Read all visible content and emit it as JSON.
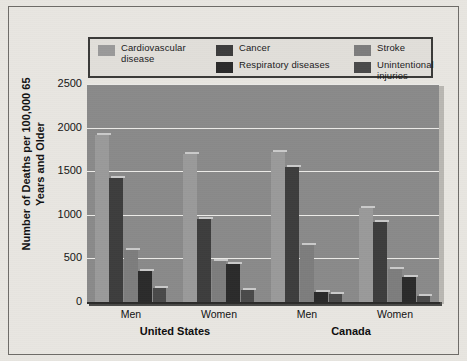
{
  "chart_data": {
    "type": "bar",
    "title": "",
    "subtitle": "",
    "xlabel": "",
    "ylabel": "Number of Deaths per\n100,000 65 Years and Older",
    "ylim": [
      0,
      2500
    ],
    "yticks": [
      0,
      500,
      1000,
      1500,
      2000,
      2500
    ],
    "ytick_labels": [
      "0",
      "500",
      "1000",
      "1500",
      "2000",
      "2500"
    ],
    "grid": true,
    "legend_position": "top",
    "categories": [
      "Men",
      "Women",
      "Men",
      "Women"
    ],
    "group_labels": [
      "United States",
      "Canada"
    ],
    "groups": [
      {
        "country": "United States",
        "sex": "Men"
      },
      {
        "country": "United States",
        "sex": "Women"
      },
      {
        "country": "Canada",
        "sex": "Men"
      },
      {
        "country": "Canada",
        "sex": "Women"
      }
    ],
    "series": [
      {
        "name": "Cardiovascular disease",
        "color": "#9a9a9a",
        "values": [
          1910,
          1700,
          1720,
          1080
        ]
      },
      {
        "name": "Cancer",
        "color": "#3d3d3d",
        "values": [
          1420,
          950,
          1550,
          920
        ]
      },
      {
        "name": "Stroke",
        "color": "#7d7d7d",
        "values": [
          600,
          470,
          650,
          380
        ]
      },
      {
        "name": "Respiratory diseases",
        "color": "#2b2b2b",
        "values": [
          350,
          440,
          110,
          290
        ]
      },
      {
        "name": "Unintentional injuries",
        "color": "#4a4a4a",
        "values": [
          160,
          140,
          95,
          70
        ]
      }
    ]
  },
  "legend": {
    "columns": [
      {
        "entries": [
          {
            "label": "Cardiovascular\ndisease",
            "color": "#9a9a9a",
            "swatch_name": "legend-swatch-cardiovascular-disease"
          }
        ]
      },
      {
        "entries": [
          {
            "label": "Cancer",
            "color": "#3d3d3d",
            "swatch_name": "legend-swatch-cancer"
          },
          {
            "label": "Respiratory diseases",
            "color": "#2b2b2b",
            "swatch_name": "legend-swatch-respiratory-diseases"
          }
        ]
      },
      {
        "entries": [
          {
            "label": "Stroke",
            "color": "#7d7d7d",
            "swatch_name": "legend-swatch-stroke"
          },
          {
            "label": "Unintentional injuries",
            "color": "#4a4a4a",
            "swatch_name": "legend-swatch-unintentional-injuries"
          }
        ]
      }
    ]
  },
  "colors": {
    "page_background": "#e8e6e1",
    "plot_background": "#8a8a8a",
    "gridline": "#ecebe8",
    "axis": "#2b2b29",
    "frame_border": "#6e6c68",
    "legend_border": "#3a3a38",
    "legend_background": "#e1dfda",
    "text": "#111111"
  }
}
